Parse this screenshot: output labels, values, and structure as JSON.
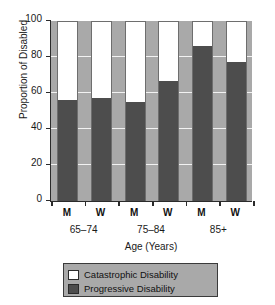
{
  "chart_data": {
    "type": "bar",
    "subtype": "stacked-100-percent",
    "title": "",
    "xlabel": "Age (Years)",
    "ylabel": "Proportion of Disabled",
    "ylim": [
      0,
      100
    ],
    "yticks": [
      0,
      20,
      40,
      60,
      80,
      100
    ],
    "ytick_labels": [
      "0",
      "20",
      "40",
      "60",
      "80",
      "100"
    ],
    "grid": true,
    "grid_axis": "y",
    "legend_position": "below",
    "categories": [
      "M",
      "W",
      "M",
      "W",
      "M",
      "W"
    ],
    "groups": [
      {
        "label": "65–74",
        "members": [
          "M",
          "W"
        ]
      },
      {
        "label": "75–84",
        "members": [
          "M",
          "W"
        ]
      },
      {
        "label": "85+",
        "members": [
          "M",
          "W"
        ]
      }
    ],
    "series": [
      {
        "name": "Progressive Disability",
        "color": "#4d4d4d",
        "values": [
          56.5,
          57.5,
          55.5,
          67.0,
          86.5,
          77.5
        ]
      },
      {
        "name": "Catastrophic Disability",
        "color": "#ffffff",
        "values": [
          43.5,
          42.5,
          44.5,
          33.0,
          13.5,
          22.5
        ]
      }
    ],
    "bars": [
      {
        "group": "65–74",
        "sex": "M",
        "progressive": 56.5,
        "catastrophic": 43.5
      },
      {
        "group": "65–74",
        "sex": "W",
        "progressive": 57.5,
        "catastrophic": 42.5
      },
      {
        "group": "75–84",
        "sex": "M",
        "progressive": 55.5,
        "catastrophic": 44.5
      },
      {
        "group": "75–84",
        "sex": "W",
        "progressive": 67.0,
        "catastrophic": 33.0
      },
      {
        "group": "85+",
        "sex": "M",
        "progressive": 86.5,
        "catastrophic": 13.5
      },
      {
        "group": "85+",
        "sex": "W",
        "progressive": 77.5,
        "catastrophic": 22.5
      }
    ]
  },
  "legend": {
    "items": [
      {
        "label": "Catastrophic Disability",
        "swatch": "white"
      },
      {
        "label": "Progressive Disability",
        "swatch": "dark-gray"
      }
    ]
  },
  "colors": {
    "plot_background": "#a9a9a9",
    "progressive": "#4d4d4d",
    "catastrophic": "#ffffff",
    "gridline": "#f2f2f2",
    "axis": "#2b2b2b",
    "page_background": "#ffffff"
  }
}
